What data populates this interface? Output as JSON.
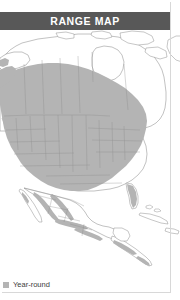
{
  "card": {
    "header": {
      "title": "RANGE MAP",
      "background_color": "#585858",
      "text_color": "#ffffff"
    },
    "legend": {
      "items": [
        {
          "label": "Year-round",
          "swatch_color": "#b4b4b4",
          "swatch_icon": "filled-square-icon"
        }
      ]
    },
    "map": {
      "region": "North America",
      "land_fill": "#ffffff",
      "range_fill": "#b4b4b4",
      "outline_color": "#8c8c8c",
      "water_fill": "#ffffff",
      "border_color": "#d8d8d8"
    }
  }
}
